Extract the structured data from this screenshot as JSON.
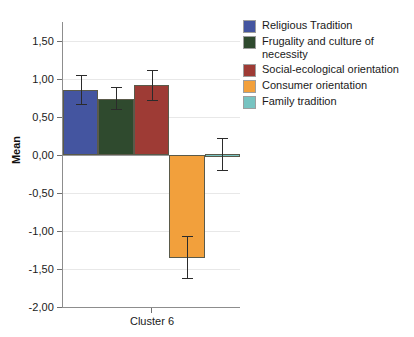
{
  "chart_data": {
    "type": "bar",
    "title": "",
    "subtitle": "",
    "xlabel": "",
    "ylabel": "Mean",
    "categories": [
      "Cluster 6"
    ],
    "ylim": [
      -2.0,
      1.75
    ],
    "ytick_labels": [
      "1,50",
      "1,00",
      "0,50",
      "0,00",
      "-0,50",
      "-1,00",
      "-1,50",
      "-2,00"
    ],
    "ytick_values": [
      1.5,
      1.0,
      0.5,
      0.0,
      -0.5,
      -1.0,
      -1.5,
      -2.0
    ],
    "grid": true,
    "legend_position": "right",
    "error_bars": "95% CI",
    "series": [
      {
        "name": "Religious Tradition",
        "color": "#4455a0",
        "values": [
          0.86
        ],
        "err_low": [
          0.67
        ],
        "err_high": [
          1.05
        ]
      },
      {
        "name": "Frugality and culture of\nnecessity",
        "color": "#2f4a2e",
        "values": [
          0.74
        ],
        "err_low": [
          0.6
        ],
        "err_high": [
          0.89
        ]
      },
      {
        "name": "Social-ecological orientation",
        "color": "#9e3b35",
        "values": [
          0.92
        ],
        "err_low": [
          0.72
        ],
        "err_high": [
          1.12
        ]
      },
      {
        "name": "Consumer orientation",
        "color": "#f2a03c",
        "values": [
          -1.35
        ],
        "err_low": [
          -1.62
        ],
        "err_high": [
          -1.06
        ]
      },
      {
        "name": "Family tradition",
        "color": "#77c3c1",
        "values": [
          0.01
        ],
        "err_low": [
          -0.2
        ],
        "err_high": [
          0.22
        ]
      }
    ]
  },
  "legend": {
    "items": [
      {
        "label": "Religious Tradition",
        "color": "#4455a0"
      },
      {
        "label": "Frugality and culture of\nnecessity",
        "color": "#2f4a2e"
      },
      {
        "label": "Social-ecological orientation",
        "color": "#9e3b35"
      },
      {
        "label": "Consumer orientation",
        "color": "#f2a03c"
      },
      {
        "label": "Family tradition",
        "color": "#77c3c1"
      }
    ]
  },
  "axes": {
    "y_title": "Mean",
    "x_category": "Cluster 6"
  }
}
